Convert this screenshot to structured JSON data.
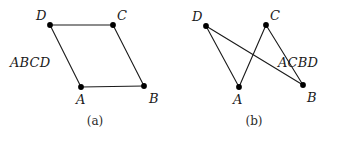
{
  "figure": {
    "background_color": "#ffffff",
    "edge_color": "#1a1a1a",
    "vertex_color": "#000000",
    "text_color": "#1a1a1a",
    "width": 348,
    "height": 141
  },
  "chart_data": {
    "type": "diagram",
    "subtype": "graph-drawing",
    "title": "",
    "panels": [
      {
        "id": "a",
        "caption": "(a)",
        "cycle_label": "ABCD",
        "crossings": 0,
        "planar": true,
        "nodes": [
          {
            "id": "D",
            "label": "D",
            "x": 50,
            "y": 25
          },
          {
            "id": "C",
            "label": "C",
            "x": 113,
            "y": 25
          },
          {
            "id": "A",
            "label": "A",
            "x": 81,
            "y": 87
          },
          {
            "id": "B",
            "label": "B",
            "x": 144,
            "y": 86
          }
        ],
        "edges": [
          {
            "from": "D",
            "to": "C"
          },
          {
            "from": "C",
            "to": "B"
          },
          {
            "from": "B",
            "to": "A"
          },
          {
            "from": "A",
            "to": "D"
          }
        ]
      },
      {
        "id": "b",
        "caption": "(b)",
        "cycle_label": "ACBD",
        "crossings": 1,
        "planar": false,
        "nodes": [
          {
            "id": "D",
            "label": "D",
            "x": 32,
            "y": 26
          },
          {
            "id": "C",
            "label": "C",
            "x": 92,
            "y": 25
          },
          {
            "id": "A",
            "label": "A",
            "x": 65,
            "y": 87
          },
          {
            "id": "B",
            "label": "B",
            "x": 129,
            "y": 85
          }
        ],
        "edges": [
          {
            "from": "A",
            "to": "C"
          },
          {
            "from": "C",
            "to": "B"
          },
          {
            "from": "B",
            "to": "D"
          },
          {
            "from": "D",
            "to": "A"
          }
        ]
      }
    ]
  },
  "panel_a": {
    "caption": "(a)",
    "cycle_label": "ABCD",
    "labels": {
      "A": "A",
      "B": "B",
      "C": "C",
      "D": "D"
    }
  },
  "panel_b": {
    "caption": "(b)",
    "cycle_label": "ACBD",
    "labels": {
      "A": "A",
      "B": "B",
      "C": "C",
      "D": "D"
    }
  }
}
